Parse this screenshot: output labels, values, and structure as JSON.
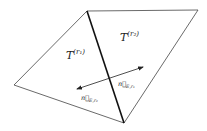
{
  "diagram": {
    "type": "two adjacent triangles sharing an edge with opposite normal vectors",
    "vertices": {
      "top": [
        87,
        11
      ],
      "top_right": [
        198,
        10
      ],
      "bottom": [
        124,
        123
      ],
      "left": [
        14,
        85
      ]
    },
    "shared_edge": {
      "from": "top",
      "to": "bottom",
      "emphasis": "bold"
    },
    "labels": {
      "triangle_1": {
        "base": "T",
        "superscript": "(r₁)"
      },
      "triangle_2": {
        "base": "T",
        "superscript": "(r₂)"
      },
      "normal_1": {
        "base": "n⃗",
        "subscript": "E,r₁"
      },
      "normal_2": {
        "base": "n⃗",
        "subscript": "E,r₂"
      }
    },
    "arrows": [
      {
        "name": "normal_E_r1",
        "from": [
          110,
          78
        ],
        "to": [
          143,
          67
        ]
      },
      {
        "name": "normal_E_r2",
        "from": [
          110,
          78
        ],
        "to": [
          77,
          89
        ]
      }
    ],
    "colors": {
      "line": "#333333",
      "bold_edge": "#111111",
      "background": "#ffffff"
    }
  }
}
